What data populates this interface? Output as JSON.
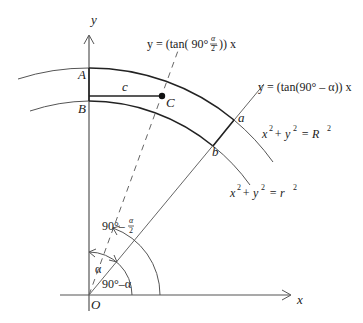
{
  "diagram": {
    "axes": {
      "x_label": "x",
      "y_label": "y",
      "origin_label": "O"
    },
    "points": {
      "A": "A",
      "B": "B",
      "C": "C",
      "a": "a",
      "b": "b",
      "c": "c"
    },
    "equations": {
      "dashed_line_prefix": "y = (tan( 90° – ",
      "dashed_line_frac_num": "α",
      "dashed_line_frac_den": "2",
      "dashed_line_suffix": ")) x",
      "solid_line": "y = (tan(90° – α)) x",
      "outer_circle_x": "x",
      "outer_circle_plus": "+ y",
      "outer_circle_eq": "=  R",
      "inner_circle_x": "x",
      "inner_circle_plus": "+ y",
      "inner_circle_eq": "=  r",
      "sup2": "2"
    },
    "angles": {
      "half_angle_prefix": "90°–",
      "half_angle_num": "α",
      "half_angle_den": "2",
      "alpha": "α",
      "complement": "90°–α"
    },
    "colors": {
      "stroke": "#555555",
      "bold_stroke": "#222222",
      "background": "#ffffff"
    }
  }
}
